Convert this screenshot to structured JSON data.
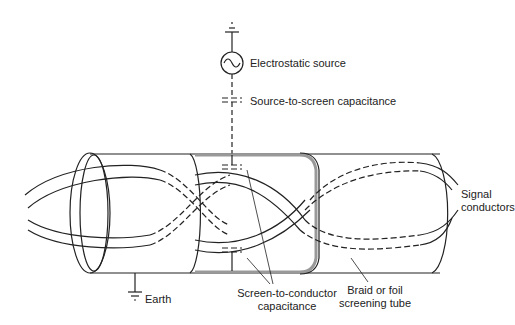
{
  "diagram": {
    "labels": {
      "source": "Electrostatic source",
      "source_cap": "Source-to-screen capacitance",
      "signal_1": "Signal",
      "signal_2": "conductors",
      "earth": "Earth",
      "stc_1": "Screen-to-conductor",
      "stc_2": "capacitance",
      "tube_1": "Braid or foil",
      "tube_2": "screening tube"
    },
    "colors": {
      "line": "#222222",
      "screen": "#999999"
    }
  }
}
